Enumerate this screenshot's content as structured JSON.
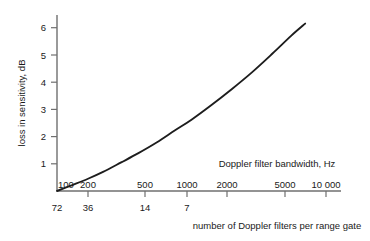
{
  "chart_data": {
    "type": "line",
    "title": "",
    "xlabel": "Doppler filter bandwidth, Hz",
    "xlabel_secondary": "number of Doppler filters per range gate",
    "ylabel": "loss in sensitivity, dB",
    "x_scale": "log",
    "xlim": [
      100,
      13000
    ],
    "ylim": [
      0,
      6.4
    ],
    "grid": false,
    "legend": "none",
    "x_ticks_top": [
      "100",
      "200",
      "500",
      "1000",
      "2000",
      "5000",
      "10 000"
    ],
    "x_tick_values_top": [
      100,
      200,
      500,
      1000,
      2000,
      5000,
      10000
    ],
    "x_ticks_bottom": [
      "72",
      "36",
      "14",
      "7"
    ],
    "x_tick_values_bottom": [
      72,
      36,
      14,
      7
    ],
    "x_tick_bottom_positions": [
      100,
      200,
      500,
      1000
    ],
    "y_ticks": [
      "1",
      "2",
      "3",
      "4",
      "5",
      "6"
    ],
    "y_tick_values": [
      1,
      2,
      3,
      4,
      5,
      6
    ],
    "series": [
      {
        "name": "loss in sensitivity",
        "x": [
          100,
          130,
          170,
          220,
          300,
          400,
          550,
          750,
          1000,
          1400,
          2000,
          2800,
          4000,
          5500,
          7000
        ],
        "values": [
          0.0,
          0.22,
          0.45,
          0.7,
          1.05,
          1.38,
          1.78,
          2.22,
          2.62,
          3.15,
          3.75,
          4.35,
          5.05,
          5.7,
          6.15
        ]
      }
    ],
    "colors": {
      "curve": "#1d1d1d",
      "axis": "#6f6f6f",
      "text": "#1a1a1a",
      "background": "#ffffff"
    }
  }
}
